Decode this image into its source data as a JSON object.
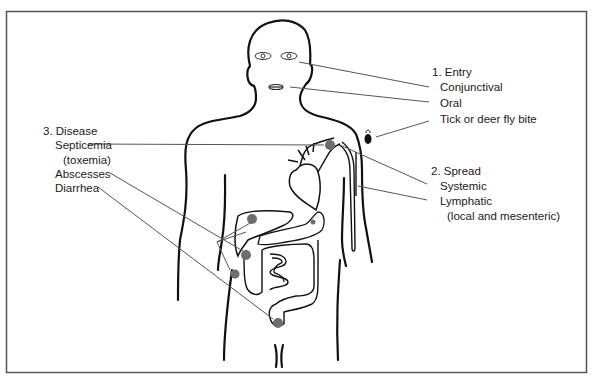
{
  "diagram": {
    "type": "anatomical infection pathway diagram",
    "colors": {
      "outline": "#1a1a1a",
      "frame": "#555555",
      "site_dot": "#6e6e6e",
      "leader": "#555555"
    },
    "entry": {
      "heading": "1. Entry",
      "items": [
        "Conjunctival",
        "Oral",
        "Tick or deer fly bite"
      ]
    },
    "spread": {
      "heading": "2. Spread",
      "items": [
        "Systemic",
        "Lymphatic",
        "(local and mesenteric)"
      ]
    },
    "disease": {
      "heading": "3. Disease",
      "items": [
        "Septicemia",
        "(toxemia)",
        "Abscesses",
        "Diarrhea"
      ]
    },
    "icons": [
      "human-body-outline",
      "eyes",
      "mouth",
      "tick",
      "heart",
      "liver",
      "intestines",
      "lymph-vessels",
      "site-dots"
    ]
  }
}
